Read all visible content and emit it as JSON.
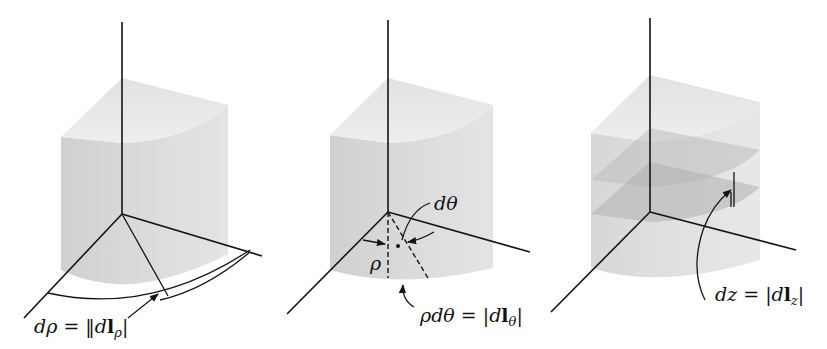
{
  "figures": [
    {
      "id": "rho",
      "label": {
        "lhs": "dρ",
        "eq": " = ",
        "bar_open": "‖",
        "d": "d",
        "bold": "l",
        "sub": "ρ",
        "bar_close": "|"
      },
      "description": "Differential length in the radial (ρ) direction"
    },
    {
      "id": "theta",
      "label": {
        "lhs": "ρdθ",
        "eq": " = ",
        "bar_open": "|",
        "d": "d",
        "bold": "l",
        "sub": "θ",
        "bar_close": "|"
      },
      "angle_label": "dθ",
      "radius_label": "ρ",
      "description": "Differential length in the azimuthal (θ) direction"
    },
    {
      "id": "z",
      "label": {
        "lhs": "dz",
        "eq": " = ",
        "bar_open": "|",
        "d": "d",
        "bold": "l",
        "sub": "z",
        "bar_close": "|"
      },
      "description": "Differential length in the axial (z) direction"
    }
  ],
  "colors": {
    "line": "#141414",
    "solid_side": "#d6d6d6",
    "solid_top": "#e9e9e9",
    "slab": "#bdbdbd",
    "background": "#ffffff"
  }
}
